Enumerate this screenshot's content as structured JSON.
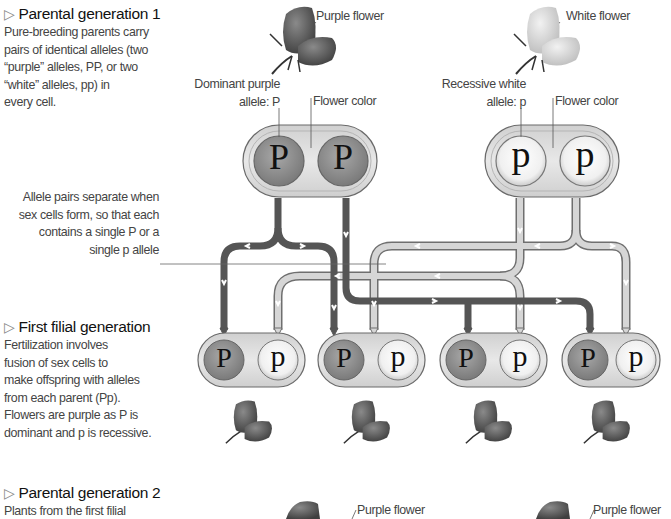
{
  "sections": {
    "parental1": {
      "heading": "Parental generation 1",
      "lines": [
        "Pure-breeding parents carry",
        "pairs of identical alleles (two",
        "“purple” alleles, PP, or two",
        "“white” alleles, pp) in",
        "every cell."
      ]
    },
    "separation": {
      "lines": [
        "Allele pairs separate when",
        "sex cells form, so that each",
        "contains a single P or a",
        "single p allele"
      ]
    },
    "filial1": {
      "heading": "First filial generation",
      "lines": [
        "Fertilization involves",
        "fusion of sex cells to",
        "make offspring with alleles",
        "from each parent (Pp).",
        "Flowers are purple as P is",
        "dominant and p is recessive."
      ]
    },
    "parental2": {
      "heading": "Parental generation 2",
      "lines": [
        "Plants from the first filial"
      ]
    }
  },
  "labels": {
    "purple_flower": "Purple flower",
    "white_flower": "White flower",
    "dominant_line1": "Dominant purple",
    "dominant_line2": "allele: P",
    "recessive_line1": "Recessive white",
    "recessive_line2": "allele: p",
    "flower_color_left": "Flower color",
    "flower_color_right": "Flower color",
    "bottom_purple_left": "Purple flower",
    "bottom_purple_right": "Purple flower"
  },
  "alleles": {
    "dominant": "P",
    "recessive": "p",
    "parent_purple": [
      "P",
      "P"
    ],
    "parent_white": [
      "p",
      "p"
    ],
    "offspring": [
      [
        "P",
        "p"
      ],
      [
        "P",
        "p"
      ],
      [
        "P",
        "p"
      ],
      [
        "P",
        "p"
      ]
    ]
  },
  "colors": {
    "dominant_allele": "#8a8a8a",
    "recessive_allele": "#f4f4f4",
    "capsule": "#d9d9d9",
    "dark_arrow": "#555555",
    "light_arrow": "#d6d6d6",
    "outline": "#6a6a6a"
  }
}
